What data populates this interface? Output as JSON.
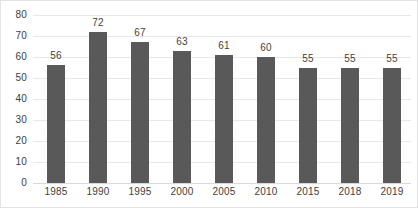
{
  "chart_data": {
    "type": "bar",
    "title": "",
    "subtitle": "",
    "xlabel": "",
    "ylabel": "",
    "categories": [
      "1985",
      "1990",
      "1995",
      "2000",
      "2005",
      "2010",
      "2015",
      "2018",
      "2019"
    ],
    "values": [
      56,
      72,
      67,
      63,
      61,
      60,
      55,
      55,
      55
    ],
    "data_labels": [
      "56",
      "72",
      "67",
      "63",
      "61",
      "60",
      "55",
      "55",
      "55"
    ],
    "ylim": [
      0,
      80
    ],
    "ytick_labels": [
      "0",
      "10",
      "20",
      "30",
      "40",
      "50",
      "60",
      "70",
      "80"
    ],
    "ytick_values": [
      0,
      10,
      20,
      30,
      40,
      50,
      60,
      70,
      80
    ],
    "grid": true,
    "legend": false,
    "legend_position": "none",
    "colors": {
      "bar": "#595959",
      "gridline": "#e8e8e8",
      "baseline": "#d9d9d9",
      "tick_text": "#404040",
      "label_text": "#3f3f3f",
      "background": "#ffffff",
      "border": "#e3e3e3"
    }
  }
}
